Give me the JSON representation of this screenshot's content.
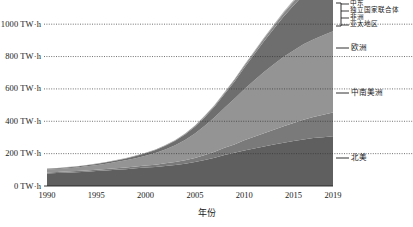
{
  "chart_data": {
    "type": "area",
    "title": "",
    "subtitle": "",
    "xlabel": "年份",
    "ylabel": "",
    "stacked": true,
    "grid": true,
    "legend_position": "right",
    "xlim": [
      1990,
      2019
    ],
    "ylim": [
      0,
      1100
    ],
    "yunit": "TW·h",
    "x": [
      1990,
      1991,
      1992,
      1993,
      1994,
      1995,
      1996,
      1997,
      1998,
      1999,
      2000,
      2001,
      2002,
      2003,
      2004,
      2005,
      2006,
      2007,
      2008,
      2009,
      2010,
      2011,
      2012,
      2013,
      2014,
      2015,
      2016,
      2017,
      2018,
      2019
    ],
    "xticks": [
      1990,
      1995,
      2000,
      2005,
      2010,
      2015,
      2019
    ],
    "xticklabels": [
      "1990",
      "1995",
      "2000",
      "2005",
      "2010",
      "2015",
      "2019"
    ],
    "yticks": [
      0,
      200,
      400,
      600,
      800,
      1000
    ],
    "yticklabels": [
      "0 TW·h",
      "200 TW·h",
      "400 TW·h",
      "600 TW·h",
      "800 TW·h",
      "1000 TW·h"
    ],
    "series": [
      {
        "name": "北美",
        "color": "#5f5f5f",
        "values": [
          78,
          80,
          82,
          85,
          88,
          92,
          96,
          100,
          104,
          109,
          114,
          118,
          124,
          130,
          138,
          148,
          161,
          175,
          192,
          205,
          220,
          232,
          244,
          256,
          268,
          278,
          288,
          296,
          302,
          308
        ]
      },
      {
        "name": "中南美洲",
        "color": "#7a7a7a",
        "values": [
          6,
          6,
          7,
          7,
          8,
          8,
          9,
          10,
          11,
          12,
          13,
          14,
          16,
          18,
          21,
          25,
          30,
          36,
          44,
          52,
          62,
          72,
          82,
          92,
          102,
          112,
          122,
          130,
          138,
          146
        ]
      },
      {
        "name": "欧洲",
        "color": "#949494",
        "values": [
          18,
          19,
          21,
          23,
          26,
          29,
          33,
          38,
          44,
          51,
          60,
          72,
          86,
          104,
          126,
          152,
          182,
          214,
          248,
          282,
          316,
          348,
          378,
          404,
          428,
          448,
          466,
          480,
          492,
          502
        ]
      },
      {
        "name": "亚太地区",
        "color": "#6e6e6e",
        "values": [
          4,
          4,
          5,
          5,
          6,
          7,
          8,
          9,
          11,
          13,
          15,
          18,
          22,
          27,
          33,
          41,
          52,
          66,
          84,
          106,
          132,
          160,
          190,
          220,
          250,
          278,
          304,
          326,
          344,
          358
        ]
      },
      {
        "name": "非洲",
        "color": "#888888",
        "values": [
          1,
          1,
          1,
          1,
          1,
          2,
          2,
          2,
          2,
          3,
          3,
          3,
          4,
          4,
          5,
          6,
          7,
          8,
          9,
          11,
          13,
          15,
          17,
          19,
          21,
          23,
          25,
          27,
          29,
          31
        ]
      },
      {
        "name": "独立国家联合体",
        "color": "#a0a0a0",
        "values": [
          1,
          1,
          1,
          1,
          1,
          1,
          1,
          1,
          1,
          1,
          1,
          1,
          1,
          1,
          1,
          2,
          2,
          2,
          3,
          3,
          4,
          4,
          5,
          5,
          6,
          7,
          8,
          9,
          10,
          12
        ]
      },
      {
        "name": "中东",
        "color": "#b4b4b4",
        "values": [
          0,
          0,
          0,
          0,
          0,
          0,
          0,
          0,
          0,
          0,
          0,
          0,
          0,
          0,
          0,
          0,
          1,
          1,
          1,
          1,
          1,
          2,
          2,
          2,
          3,
          3,
          4,
          4,
          5,
          6
        ]
      }
    ]
  },
  "right_labels": [
    {
      "name": "欧洲",
      "y": 48
    },
    {
      "name": "中南美洲",
      "y": 93
    },
    {
      "name": "北美",
      "y": 158
    }
  ],
  "legend_labels": [
    {
      "name": "中东",
      "y": 4
    },
    {
      "name": "独立国家联合体",
      "y": 11
    },
    {
      "name": "非洲",
      "y": 18
    },
    {
      "name": "亚太地区",
      "y": 25
    }
  ],
  "axis": {
    "x_title": "年份"
  }
}
